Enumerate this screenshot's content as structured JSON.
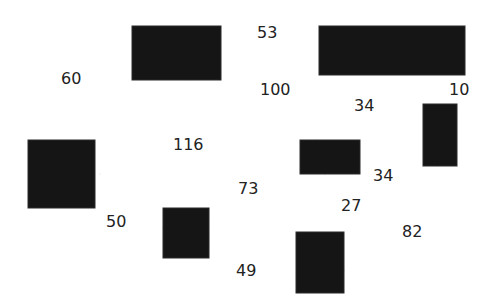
{
  "diagram": {
    "type": "weighted-graph",
    "nodes": [
      {
        "id": "n1",
        "x": 132,
        "y": 26,
        "w": 89,
        "h": 54
      },
      {
        "id": "n2",
        "x": 319,
        "y": 26,
        "w": 146,
        "h": 49
      },
      {
        "id": "n3",
        "x": 28,
        "y": 140,
        "w": 67,
        "h": 68
      },
      {
        "id": "n4",
        "x": 300,
        "y": 140,
        "w": 60,
        "h": 34
      },
      {
        "id": "n5",
        "x": 423,
        "y": 104,
        "w": 34,
        "h": 62
      },
      {
        "id": "n6",
        "x": 163,
        "y": 208,
        "w": 46,
        "h": 50
      },
      {
        "id": "n7",
        "x": 296,
        "y": 232,
        "w": 48,
        "h": 61
      }
    ],
    "edges": [
      {
        "from": "n1",
        "to": "n2",
        "weight": "53"
      },
      {
        "from": "n1",
        "to": "n3",
        "weight": "60"
      },
      {
        "from": "n1",
        "to": "n4",
        "weight": "100"
      },
      {
        "from": "n2",
        "to": "n4",
        "weight": "34"
      },
      {
        "from": "n2",
        "to": "n5",
        "weight": "10"
      },
      {
        "from": "n3",
        "to": "n4",
        "weight": "116"
      },
      {
        "from": "n4",
        "to": "n5",
        "weight": "34"
      },
      {
        "from": "n3",
        "to": "n6",
        "weight": "50"
      },
      {
        "from": "n6",
        "to": "n4",
        "weight": "73"
      },
      {
        "from": "n4",
        "to": "n7",
        "weight": "27"
      },
      {
        "from": "n6",
        "to": "n7",
        "weight": "49"
      },
      {
        "from": "n5",
        "to": "n7",
        "weight": "82"
      }
    ],
    "labels": {
      "e_n1_n2": "53",
      "e_n1_n3": "60",
      "e_n1_n4": "100",
      "e_n2_n4": "34",
      "e_n2_n5": "10",
      "e_n3_n4": "116",
      "e_n4_n5": "34",
      "e_n3_n6": "50",
      "e_n6_n4": "73",
      "e_n4_n7": "27",
      "e_n6_n7": "49",
      "e_n5_n7": "82"
    }
  }
}
